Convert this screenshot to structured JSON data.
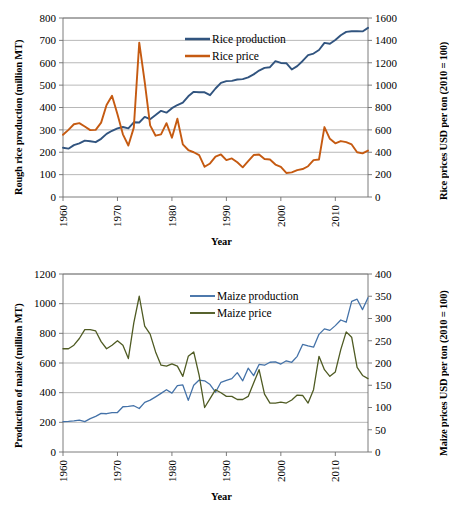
{
  "figure": {
    "panels": [
      "rice",
      "maize"
    ]
  },
  "chart_data": [
    {
      "id": "rice",
      "type": "line",
      "title": "",
      "xlabel": "Year",
      "ylabel": "Rough rice production (million MT)",
      "y2label": "Rice prices USD per ton (2010 = 100)",
      "xlim": [
        1960,
        2016
      ],
      "ylim": [
        0,
        800
      ],
      "y2lim": [
        0,
        1600
      ],
      "xticks": [
        1960,
        1970,
        1980,
        1990,
        2000,
        2010
      ],
      "yticks": [
        0,
        100,
        200,
        300,
        400,
        500,
        600,
        700,
        800
      ],
      "y2ticks": [
        0,
        200,
        400,
        600,
        800,
        1000,
        1200,
        1400,
        1600
      ],
      "grid": true,
      "legend_position": "top-center",
      "x": [
        1960,
        1961,
        1962,
        1963,
        1964,
        1965,
        1966,
        1967,
        1968,
        1969,
        1970,
        1971,
        1972,
        1973,
        1974,
        1975,
        1976,
        1977,
        1978,
        1979,
        1980,
        1981,
        1982,
        1983,
        1984,
        1985,
        1986,
        1987,
        1988,
        1989,
        1990,
        1991,
        1992,
        1993,
        1994,
        1995,
        1996,
        1997,
        1998,
        1999,
        2000,
        2001,
        2002,
        2003,
        2004,
        2005,
        2006,
        2007,
        2008,
        2009,
        2010,
        2011,
        2012,
        2013,
        2014,
        2015,
        2016
      ],
      "series": [
        {
          "name": "Rice production",
          "axis": "left",
          "color": "#31547F",
          "units": "million MT",
          "values": [
            220,
            216,
            232,
            240,
            252,
            249,
            245,
            260,
            282,
            296,
            307,
            313,
            307,
            334,
            333,
            358,
            348,
            366,
            385,
            377,
            397,
            411,
            422,
            450,
            470,
            468,
            468,
            455,
            485,
            510,
            518,
            519,
            525,
            527,
            535,
            548,
            565,
            577,
            580,
            607,
            599,
            598,
            570,
            585,
            608,
            634,
            641,
            657,
            689,
            685,
            702,
            723,
            738,
            741,
            741,
            740,
            756
          ]
        },
        {
          "name": "Rice price",
          "axis": "right",
          "color": "#C55A11",
          "units": "USD per ton (2010 = 100)",
          "values": [
            556,
            600,
            650,
            660,
            630,
            598,
            600,
            665,
            822,
            905,
            740,
            560,
            460,
            620,
            1380,
            1030,
            640,
            548,
            560,
            660,
            530,
            700,
            470,
            420,
            400,
            375,
            270,
            300,
            360,
            380,
            330,
            345,
            310,
            265,
            320,
            375,
            380,
            340,
            335,
            290,
            270,
            215,
            220,
            240,
            250,
            275,
            330,
            335,
            625,
            520,
            480,
            500,
            490,
            470,
            400,
            390,
            415
          ]
        }
      ]
    },
    {
      "id": "maize",
      "type": "line",
      "title": "",
      "xlabel": "Year",
      "ylabel": "Production of maize (million MT)",
      "y2label": "Maize prices USD per ton (2010 = 100)",
      "xlim": [
        1960,
        2016
      ],
      "ylim": [
        0,
        1200
      ],
      "y2lim": [
        0,
        400
      ],
      "xticks": [
        1960,
        1970,
        1980,
        1990,
        2000,
        2010
      ],
      "yticks": [
        0,
        200,
        400,
        600,
        800,
        1000,
        1200
      ],
      "y2ticks": [
        0,
        50,
        100,
        150,
        200,
        250,
        300,
        350,
        400
      ],
      "grid": true,
      "legend_position": "top-center",
      "x": [
        1960,
        1961,
        1962,
        1963,
        1964,
        1965,
        1966,
        1967,
        1968,
        1969,
        1970,
        1971,
        1972,
        1973,
        1974,
        1975,
        1976,
        1977,
        1978,
        1979,
        1980,
        1981,
        1982,
        1983,
        1984,
        1985,
        1986,
        1987,
        1988,
        1989,
        1990,
        1991,
        1992,
        1993,
        1994,
        1995,
        1996,
        1997,
        1998,
        1999,
        2000,
        2001,
        2002,
        2003,
        2004,
        2005,
        2006,
        2007,
        2008,
        2009,
        2010,
        2011,
        2012,
        2013,
        2014,
        2015,
        2016
      ],
      "series": [
        {
          "name": "Maize production",
          "axis": "left",
          "color": "#4472A8",
          "units": "million MT",
          "values": [
            205,
            207,
            210,
            215,
            205,
            225,
            240,
            260,
            258,
            266,
            266,
            305,
            307,
            312,
            293,
            335,
            350,
            372,
            395,
            420,
            397,
            448,
            452,
            348,
            450,
            485,
            480,
            455,
            403,
            470,
            483,
            495,
            535,
            480,
            565,
            515,
            590,
            585,
            605,
            608,
            593,
            615,
            605,
            645,
            725,
            715,
            707,
            793,
            830,
            820,
            852,
            890,
            875,
            1015,
            1030,
            960,
            1040
          ]
        },
        {
          "name": "Maize price",
          "axis": "right",
          "color": "#4F5B23",
          "units": "USD per ton (2010 = 100)",
          "values": [
            232,
            232,
            240,
            255,
            275,
            275,
            272,
            248,
            232,
            240,
            250,
            240,
            210,
            290,
            350,
            283,
            265,
            225,
            195,
            193,
            198,
            193,
            170,
            215,
            225,
            172,
            100,
            120,
            140,
            133,
            125,
            125,
            118,
            118,
            125,
            155,
            185,
            130,
            110,
            110,
            112,
            110,
            117,
            128,
            127,
            110,
            140,
            215,
            185,
            170,
            180,
            230,
            270,
            258,
            190,
            172,
            165
          ]
        }
      ]
    }
  ]
}
